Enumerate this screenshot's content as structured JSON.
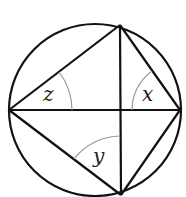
{
  "diagram": {
    "type": "geometry-circle-inscribed-quadrilateral",
    "circle": {
      "cx": 95,
      "cy": 110,
      "r": 87
    },
    "points": {
      "left": {
        "x": 9,
        "y": 110
      },
      "top": {
        "x": 120,
        "y": 25
      },
      "right": {
        "x": 180,
        "y": 110
      },
      "bottom": {
        "x": 121,
        "y": 195
      }
    },
    "segments": [
      {
        "from": "left",
        "to": "top"
      },
      {
        "from": "top",
        "to": "right"
      },
      {
        "from": "right",
        "to": "bottom"
      },
      {
        "from": "bottom",
        "to": "left"
      },
      {
        "from": "left",
        "to": "right"
      },
      {
        "from": "top",
        "to": "bottom"
      }
    ],
    "angles": [
      {
        "label": "z",
        "vertex": "left",
        "between": [
          "top",
          "right"
        ]
      },
      {
        "label": "x",
        "vertex": "right",
        "between": [
          "top",
          "left"
        ]
      },
      {
        "label": "y",
        "vertex": "bottom",
        "between": [
          "left",
          "top"
        ]
      }
    ],
    "colors": {
      "stroke": "#111111",
      "arc": "#999999",
      "text": "#222222"
    }
  },
  "labels": {
    "z": "z",
    "x": "x",
    "y": "y"
  }
}
